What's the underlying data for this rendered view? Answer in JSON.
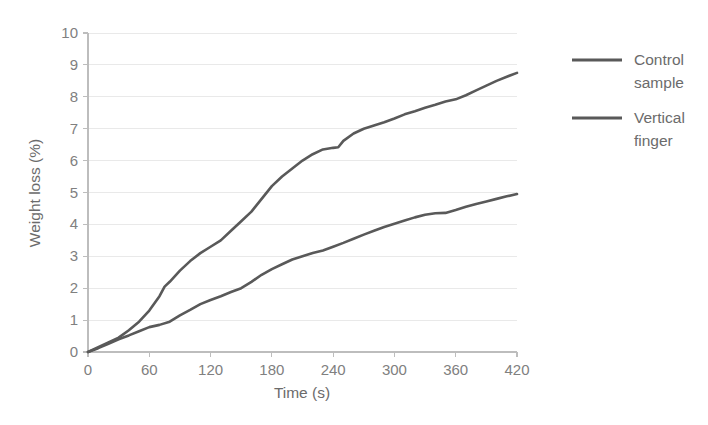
{
  "chart_data": {
    "type": "line",
    "title": "",
    "xlabel": "Time (s)",
    "ylabel": "Weight loss (%)",
    "xlim": [
      0,
      420
    ],
    "ylim": [
      0,
      10
    ],
    "xticks": [
      0,
      60,
      120,
      180,
      240,
      300,
      360,
      420
    ],
    "yticks": [
      0,
      1,
      2,
      3,
      4,
      5,
      6,
      7,
      8,
      9,
      10
    ],
    "grid": "horizontal",
    "legend_position": "right",
    "series": [
      {
        "name": "Control sample",
        "color": "#595959",
        "x": [
          0,
          10,
          20,
          30,
          40,
          50,
          60,
          70,
          80,
          90,
          100,
          110,
          120,
          130,
          140,
          150,
          160,
          170,
          180,
          190,
          200,
          210,
          220,
          230,
          240,
          250,
          260,
          270,
          280,
          290,
          300,
          310,
          320,
          330,
          340,
          350,
          360,
          370,
          380,
          390,
          400,
          410,
          420
        ],
        "y": [
          0.0,
          0.12,
          0.26,
          0.4,
          0.52,
          0.65,
          0.78,
          0.85,
          0.95,
          1.15,
          1.32,
          1.5,
          1.63,
          1.75,
          1.88,
          2.0,
          2.2,
          2.42,
          2.6,
          2.75,
          2.9,
          3.0,
          3.1,
          3.18,
          3.3,
          3.42,
          3.55,
          3.68,
          3.8,
          3.92,
          4.02,
          4.12,
          4.22,
          4.3,
          4.35,
          4.36,
          4.45,
          4.55,
          4.64,
          4.72,
          4.8,
          4.88,
          4.95
        ]
      },
      {
        "name": "Vertical finger",
        "color": "#595959",
        "x": [
          0,
          10,
          20,
          30,
          40,
          50,
          60,
          70,
          75,
          80,
          90,
          100,
          110,
          120,
          130,
          140,
          150,
          160,
          170,
          180,
          190,
          200,
          210,
          220,
          230,
          240,
          245,
          250,
          260,
          270,
          280,
          290,
          300,
          310,
          320,
          330,
          340,
          350,
          360,
          370,
          380,
          390,
          400,
          410,
          420
        ],
        "y": [
          0.0,
          0.15,
          0.3,
          0.45,
          0.68,
          0.95,
          1.3,
          1.75,
          2.05,
          2.2,
          2.55,
          2.85,
          3.1,
          3.3,
          3.5,
          3.8,
          4.1,
          4.4,
          4.8,
          5.2,
          5.5,
          5.75,
          6.0,
          6.2,
          6.35,
          6.4,
          6.42,
          6.62,
          6.85,
          7.0,
          7.1,
          7.2,
          7.32,
          7.45,
          7.55,
          7.66,
          7.75,
          7.85,
          7.92,
          8.05,
          8.2,
          8.35,
          8.5,
          8.63,
          8.75
        ]
      }
    ]
  },
  "legend": {
    "entries": [
      {
        "line1": "Control",
        "line2": "sample"
      },
      {
        "line1": "Vertical",
        "line2": "finger"
      }
    ]
  },
  "colors": {
    "series": "#595959",
    "gridline": "#e9e9e9",
    "axis": "#bdbdbd",
    "tick_label": "#808080",
    "axis_title": "#6b6b6b",
    "background": "#ffffff"
  }
}
